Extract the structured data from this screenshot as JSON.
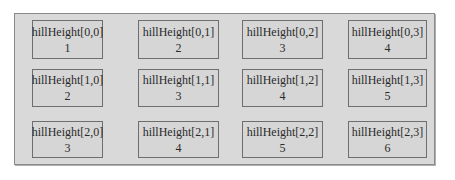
{
  "diagram": {
    "array_name": "hillHeight",
    "rows": 3,
    "cols": 4,
    "cells": [
      [
        {
          "label": "hillHeight[0,0]",
          "value": "1"
        },
        {
          "label": "hillHeight[0,1]",
          "value": "2"
        },
        {
          "label": "hillHeight[0,2]",
          "value": "3"
        },
        {
          "label": "hillHeight[0,3]",
          "value": "4"
        }
      ],
      [
        {
          "label": "hillHeight[1,0]",
          "value": "2"
        },
        {
          "label": "hillHeight[1,1]",
          "value": "3"
        },
        {
          "label": "hillHeight[1,2]",
          "value": "4"
        },
        {
          "label": "hillHeight[1,3]",
          "value": "5"
        }
      ],
      [
        {
          "label": "hillHeight[2,0]",
          "value": "3"
        },
        {
          "label": "hillHeight[2,1]",
          "value": "4"
        },
        {
          "label": "hillHeight[2,2]",
          "value": "5"
        },
        {
          "label": "hillHeight[2,3]",
          "value": "6"
        }
      ]
    ],
    "colors": {
      "frame_background": "#d9d9d9",
      "cell_border": "#6e6e6e",
      "text": "#2a2a2a"
    }
  }
}
